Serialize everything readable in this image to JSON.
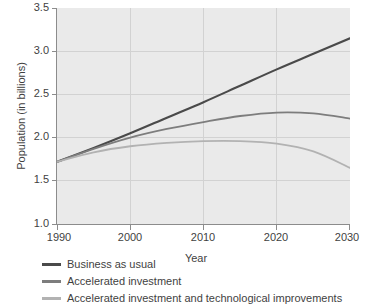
{
  "chart_data": {
    "type": "line",
    "title": "",
    "xlabel": "Year",
    "ylabel": "Population (in billions)",
    "xlim": [
      1990,
      2030
    ],
    "ylim": [
      1.0,
      3.5
    ],
    "xticks": [
      "1990",
      "2000",
      "2010",
      "2020",
      "2030"
    ],
    "yticks": [
      "1.0",
      "1.5",
      "2.0",
      "2.5",
      "3.0",
      "3.5"
    ],
    "grid": true,
    "legend_position": "below-left",
    "plot_background": "#eaeaea",
    "gridline_color": "#d2d2d2",
    "axis_color": "#8c8c8c",
    "x": [
      1990,
      1995,
      2000,
      2005,
      2010,
      2015,
      2020,
      2025,
      2030
    ],
    "series": [
      {
        "name": "Business as usual",
        "color": "#4a4a4a",
        "values": [
          1.72,
          1.88,
          2.05,
          2.23,
          2.41,
          2.6,
          2.79,
          2.97,
          3.15
        ]
      },
      {
        "name": "Accelerated investment",
        "color": "#7d7d7d",
        "values": [
          1.72,
          1.87,
          2.0,
          2.1,
          2.18,
          2.25,
          2.29,
          2.28,
          2.22
        ]
      },
      {
        "name": "Accelerated investment and technological improvements",
        "color": "#b2b2b2",
        "values": [
          1.72,
          1.83,
          1.9,
          1.94,
          1.96,
          1.96,
          1.93,
          1.84,
          1.65
        ]
      }
    ]
  },
  "legend": {
    "items": [
      {
        "label": "Business as usual",
        "color": "#4a4a4a"
      },
      {
        "label": "Accelerated investment",
        "color": "#7d7d7d"
      },
      {
        "label": "Accelerated investment and technological improvements",
        "color": "#b2b2b2"
      }
    ]
  },
  "axes": {
    "x_title": "Year",
    "y_title": "Population (in billions)",
    "x_ticks": [
      "1990",
      "2000",
      "2010",
      "2020",
      "2030"
    ],
    "y_ticks": [
      "1.0",
      "1.5",
      "2.0",
      "2.5",
      "3.0",
      "3.5"
    ]
  }
}
